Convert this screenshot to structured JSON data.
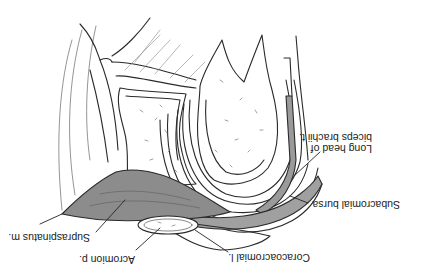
{
  "figure": {
    "orientation": "rotated 180 degrees",
    "colors": {
      "background": "#ffffff",
      "outline": "#2a2a2a",
      "muscle_fill": "#8c8c8c",
      "tendon_fill": "#9a9a9a",
      "bone_fill": "#ffffff",
      "stipple": "#777777"
    },
    "labels": [
      {
        "id": "long-head-biceps",
        "lines": [
          "Long head of",
          "biceps brachii t."
        ]
      },
      {
        "id": "subacromial-bursa",
        "lines": [
          "Subacromial bursa"
        ]
      },
      {
        "id": "coracoacromial-ligament",
        "lines": [
          "Coracoacromial l."
        ]
      },
      {
        "id": "supraspinatus",
        "lines": [
          "Supraspinatus m."
        ]
      },
      {
        "id": "acromion",
        "lines": [
          "Acromion p."
        ]
      }
    ]
  }
}
